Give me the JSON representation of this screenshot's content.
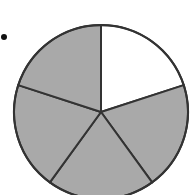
{
  "diagram": {
    "type": "fraction-circle",
    "total_sectors": 5,
    "shaded_sectors": 4,
    "unshaded_sectors": 1,
    "fraction_shaded": "4/5",
    "sectors": [
      {
        "index": 0,
        "shaded": false
      },
      {
        "index": 1,
        "shaded": true
      },
      {
        "index": 2,
        "shaded": true
      },
      {
        "index": 3,
        "shaded": true
      },
      {
        "index": 4,
        "shaded": true
      }
    ],
    "colors": {
      "shaded": "#a9a9a9",
      "unshaded": "#ffffff",
      "stroke": "#333333"
    },
    "bullet": true
  }
}
